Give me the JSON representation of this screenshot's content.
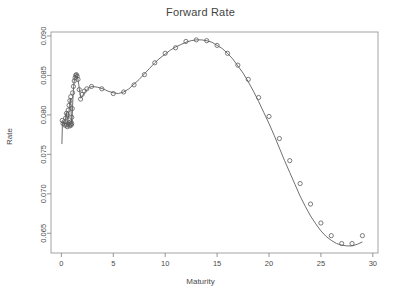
{
  "chart_data": {
    "type": "scatter",
    "title": "Forward Rate",
    "xlabel": "Maturity",
    "ylabel": "Rate",
    "grid": false,
    "legend": null,
    "xlim": [
      -1.0,
      30.5
    ],
    "ylim": [
      0.0625,
      0.0905
    ],
    "xticks": [
      0,
      5,
      10,
      15,
      20,
      25,
      30
    ],
    "xtick_labels": [
      "0",
      "5",
      "10",
      "15",
      "20",
      "25",
      "30"
    ],
    "yticks": [
      0.065,
      0.07,
      0.075,
      0.08,
      0.085,
      0.09
    ],
    "ytick_labels": [
      "0.065",
      "0.070",
      "0.075",
      "0.080",
      "0.085",
      "0.090"
    ],
    "series": [
      {
        "name": "observed",
        "type": "scatter",
        "marker": "open-circle",
        "color": "#5a5a5a",
        "points": [
          [
            0.08,
            0.0793
          ],
          [
            0.16,
            0.0789
          ],
          [
            0.25,
            0.0791
          ],
          [
            0.33,
            0.0787
          ],
          [
            0.41,
            0.0796
          ],
          [
            0.49,
            0.0802
          ],
          [
            0.49,
            0.0787
          ],
          [
            0.57,
            0.0785
          ],
          [
            0.58,
            0.08
          ],
          [
            0.66,
            0.0788
          ],
          [
            0.66,
            0.0806
          ],
          [
            0.74,
            0.079
          ],
          [
            0.74,
            0.0812
          ],
          [
            0.8,
            0.0786
          ],
          [
            0.82,
            0.0818
          ],
          [
            0.86,
            0.0788
          ],
          [
            0.9,
            0.0823
          ],
          [
            0.92,
            0.0791
          ],
          [
            0.95,
            0.0787
          ],
          [
            0.99,
            0.0789
          ],
          [
            1.0,
            0.0797
          ],
          [
            1.05,
            0.0808
          ],
          [
            1.08,
            0.0828
          ],
          [
            1.16,
            0.0836
          ],
          [
            1.24,
            0.0843
          ],
          [
            1.32,
            0.0847
          ],
          [
            1.38,
            0.085
          ],
          [
            1.45,
            0.0851
          ],
          [
            1.52,
            0.0849
          ],
          [
            1.6,
            0.0845
          ],
          [
            1.72,
            0.0832
          ],
          [
            1.85,
            0.082
          ],
          [
            2.0,
            0.0826
          ],
          [
            2.2,
            0.083
          ],
          [
            2.45,
            0.0833
          ],
          [
            2.9,
            0.0836
          ],
          [
            3.9,
            0.0833
          ],
          [
            5.0,
            0.0827
          ],
          [
            6.0,
            0.0829
          ],
          [
            7.0,
            0.0838
          ],
          [
            8.0,
            0.0851
          ],
          [
            9.0,
            0.0866
          ],
          [
            10.0,
            0.0878
          ],
          [
            11.0,
            0.0885
          ],
          [
            12.0,
            0.0893
          ],
          [
            13.0,
            0.0895
          ],
          [
            14.0,
            0.0894
          ],
          [
            15.0,
            0.0888
          ],
          [
            16.0,
            0.0878
          ],
          [
            17.0,
            0.0863
          ],
          [
            18.0,
            0.0845
          ],
          [
            19.0,
            0.0822
          ],
          [
            20.0,
            0.0798
          ],
          [
            21.0,
            0.077
          ],
          [
            22.0,
            0.0742
          ],
          [
            23.0,
            0.0713
          ],
          [
            24.0,
            0.0687
          ],
          [
            25.0,
            0.0663
          ],
          [
            26.0,
            0.0647
          ],
          [
            27.0,
            0.0637
          ],
          [
            28.0,
            0.0637
          ],
          [
            29.0,
            0.0647
          ]
        ]
      },
      {
        "name": "fitted-curve",
        "type": "line",
        "color": "#555555",
        "points": [
          [
            0.05,
            0.0763
          ],
          [
            0.1,
            0.0788
          ],
          [
            0.18,
            0.0791
          ],
          [
            0.28,
            0.0788
          ],
          [
            0.36,
            0.0792
          ],
          [
            0.44,
            0.0799
          ],
          [
            0.5,
            0.0803
          ],
          [
            0.54,
            0.0794
          ],
          [
            0.6,
            0.0788
          ],
          [
            0.66,
            0.0794
          ],
          [
            0.72,
            0.0803
          ],
          [
            0.78,
            0.0812
          ],
          [
            0.84,
            0.0819
          ],
          [
            0.88,
            0.0821
          ],
          [
            0.92,
            0.0811
          ],
          [
            0.96,
            0.0796
          ],
          [
            1.0,
            0.079
          ],
          [
            1.04,
            0.0797
          ],
          [
            1.1,
            0.0818
          ],
          [
            1.18,
            0.0836
          ],
          [
            1.26,
            0.0845
          ],
          [
            1.34,
            0.0849
          ],
          [
            1.42,
            0.0851
          ],
          [
            1.5,
            0.085
          ],
          [
            1.58,
            0.0846
          ],
          [
            1.68,
            0.0838
          ],
          [
            1.78,
            0.0828
          ],
          [
            1.88,
            0.0821
          ],
          [
            2.0,
            0.0823
          ],
          [
            2.2,
            0.0828
          ],
          [
            2.45,
            0.0832
          ],
          [
            2.7,
            0.0835
          ],
          [
            3.0,
            0.0836
          ],
          [
            3.5,
            0.0835
          ],
          [
            4.0,
            0.0833
          ],
          [
            4.5,
            0.083
          ],
          [
            5.0,
            0.0828
          ],
          [
            5.5,
            0.0827
          ],
          [
            6.0,
            0.0829
          ],
          [
            6.5,
            0.0833
          ],
          [
            7.0,
            0.0839
          ],
          [
            7.5,
            0.0845
          ],
          [
            8.0,
            0.0852
          ],
          [
            8.5,
            0.0859
          ],
          [
            9.0,
            0.0866
          ],
          [
            9.5,
            0.0872
          ],
          [
            10.0,
            0.0877
          ],
          [
            10.5,
            0.0882
          ],
          [
            11.0,
            0.0886
          ],
          [
            11.5,
            0.0889
          ],
          [
            12.0,
            0.0892
          ],
          [
            12.5,
            0.0894
          ],
          [
            13.0,
            0.0895
          ],
          [
            13.5,
            0.0895
          ],
          [
            14.0,
            0.0894
          ],
          [
            14.5,
            0.0892
          ],
          [
            15.0,
            0.0888
          ],
          [
            15.5,
            0.0884
          ],
          [
            16.0,
            0.0878
          ],
          [
            16.5,
            0.0871
          ],
          [
            17.0,
            0.0862
          ],
          [
            17.5,
            0.0853
          ],
          [
            18.0,
            0.0842
          ],
          [
            18.5,
            0.083
          ],
          [
            19.0,
            0.0817
          ],
          [
            19.5,
            0.0803
          ],
          [
            20.0,
            0.0789
          ],
          [
            20.5,
            0.0774
          ],
          [
            21.0,
            0.0758
          ],
          [
            21.5,
            0.0742
          ],
          [
            22.0,
            0.0727
          ],
          [
            22.5,
            0.0712
          ],
          [
            23.0,
            0.0697
          ],
          [
            23.5,
            0.0684
          ],
          [
            24.0,
            0.0672
          ],
          [
            24.5,
            0.0662
          ],
          [
            25.0,
            0.0653
          ],
          [
            25.5,
            0.0646
          ],
          [
            26.0,
            0.0641
          ],
          [
            26.5,
            0.0637
          ],
          [
            27.0,
            0.0635
          ],
          [
            27.5,
            0.0634
          ],
          [
            28.0,
            0.0634
          ],
          [
            28.5,
            0.0636
          ],
          [
            29.0,
            0.0639
          ]
        ]
      }
    ]
  }
}
